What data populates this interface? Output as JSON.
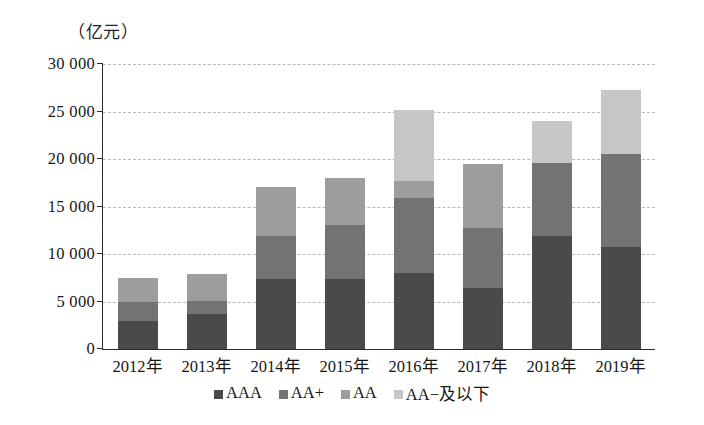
{
  "chart_data": {
    "type": "bar",
    "subtype": "stacked-bar",
    "title": "",
    "unit_label": "（亿元）",
    "xlabel": "",
    "ylabel": "",
    "ylim": [
      0,
      30000
    ],
    "ytick_values": [
      0,
      5000,
      10000,
      15000,
      20000,
      25000,
      30000
    ],
    "ytick_labels": [
      "0",
      "5 000",
      "10 000",
      "15 000",
      "20 000",
      "25 000",
      "30 000"
    ],
    "grid": true,
    "grid_style": "dashed horizontal",
    "legend_position": "bottom-center",
    "categories": [
      "2012年",
      "2013年",
      "2014年",
      "2015年",
      "2016年",
      "2017年",
      "2018年",
      "2019年"
    ],
    "series": [
      {
        "name": "AAA",
        "color": "#4a4a4a",
        "values": [
          2900,
          3700,
          7400,
          7400,
          8000,
          6400,
          11900,
          10700
        ]
      },
      {
        "name": "AA+",
        "color": "#737373",
        "values": [
          2100,
          1400,
          4500,
          5700,
          7900,
          6300,
          7700,
          9800
        ]
      },
      {
        "name": "AA",
        "color": "#9d9d9d",
        "values": [
          2500,
          2800,
          5200,
          4900,
          1800,
          6800,
          0,
          0
        ]
      },
      {
        "name": "AA−及以下",
        "color": "#c6c6c6",
        "values": [
          0,
          0,
          0,
          0,
          7500,
          0,
          4400,
          6800
        ]
      }
    ],
    "totals": [
      7500,
      7900,
      17100,
      18000,
      25200,
      19500,
      24000,
      27300
    ]
  },
  "legend": {
    "items": [
      {
        "label": "AAA",
        "color": "#4a4a4a"
      },
      {
        "label": "AA+",
        "color": "#737373"
      },
      {
        "label": "AA",
        "color": "#9d9d9d"
      },
      {
        "label": "AA−及以下",
        "color": "#c6c6c6"
      }
    ]
  }
}
